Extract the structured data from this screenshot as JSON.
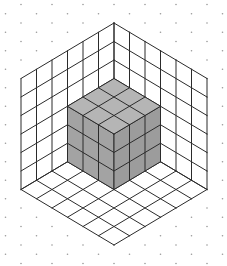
{
  "figure": {
    "title": "3x3x3 cube in corner of isometric room"
  },
  "geometry": {
    "width": 227,
    "height": 266,
    "origin": [
      114,
      134
    ],
    "unit_dx": 15.5,
    "unit_dy": 9.25,
    "unit_h": 18.5,
    "room_size": 6,
    "cube_size": 3,
    "dot_i_range": [
      -7,
      7
    ],
    "dot_j_range": [
      -14,
      14
    ]
  },
  "colors": {
    "background": "#ffffff",
    "line": "#2b2b2b",
    "dot": "#9a9a9a",
    "cube_top": "#b5b5b5",
    "cube_left": "#a3a3a3",
    "cube_right": "#9c9c9c"
  }
}
